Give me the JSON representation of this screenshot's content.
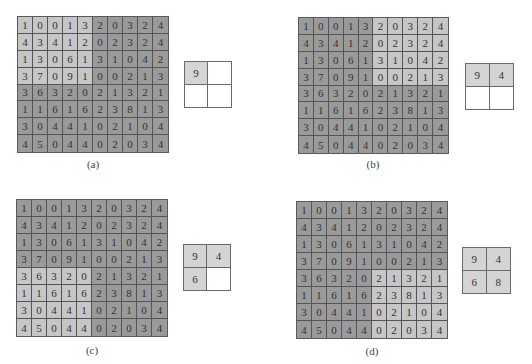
{
  "figure": {
    "matrix": [
      [
        1,
        0,
        0,
        1,
        3,
        2,
        0,
        3,
        2,
        4
      ],
      [
        4,
        3,
        4,
        1,
        2,
        0,
        2,
        3,
        2,
        4
      ],
      [
        1,
        3,
        0,
        6,
        1,
        3,
        1,
        0,
        4,
        2
      ],
      [
        3,
        7,
        0,
        9,
        1,
        0,
        0,
        2,
        1,
        3
      ],
      [
        3,
        6,
        3,
        2,
        0,
        2,
        1,
        3,
        2,
        1
      ],
      [
        1,
        1,
        6,
        1,
        6,
        2,
        3,
        8,
        1,
        3
      ],
      [
        3,
        0,
        4,
        4,
        1,
        0,
        2,
        1,
        0,
        4
      ],
      [
        4,
        5,
        0,
        4,
        4,
        0,
        2,
        0,
        3,
        4
      ]
    ],
    "colors": {
      "dark_cell": "#9a9a9a",
      "light_cell": "#c6c6c6",
      "pool_filled": "#d4d4d4",
      "pool_empty": "#ffffff"
    },
    "panels": [
      {
        "id": "a",
        "caption": "(a)",
        "highlight": {
          "rows": [
            0,
            3
          ],
          "cols": [
            0,
            4
          ]
        },
        "pool": [
          "9",
          "",
          "",
          ""
        ]
      },
      {
        "id": "b",
        "caption": "(b)",
        "highlight": {
          "rows": [
            0,
            3
          ],
          "cols": [
            5,
            9
          ]
        },
        "pool": [
          "9",
          "4",
          "",
          ""
        ]
      },
      {
        "id": "c",
        "caption": "(c)",
        "highlight": {
          "rows": [
            4,
            7
          ],
          "cols": [
            0,
            4
          ]
        },
        "pool": [
          "9",
          "4",
          "6",
          ""
        ]
      },
      {
        "id": "d",
        "caption": "(d)",
        "highlight": {
          "rows": [
            4,
            7
          ],
          "cols": [
            5,
            9
          ]
        },
        "pool": [
          "9",
          "4",
          "6",
          "8"
        ]
      }
    ]
  }
}
